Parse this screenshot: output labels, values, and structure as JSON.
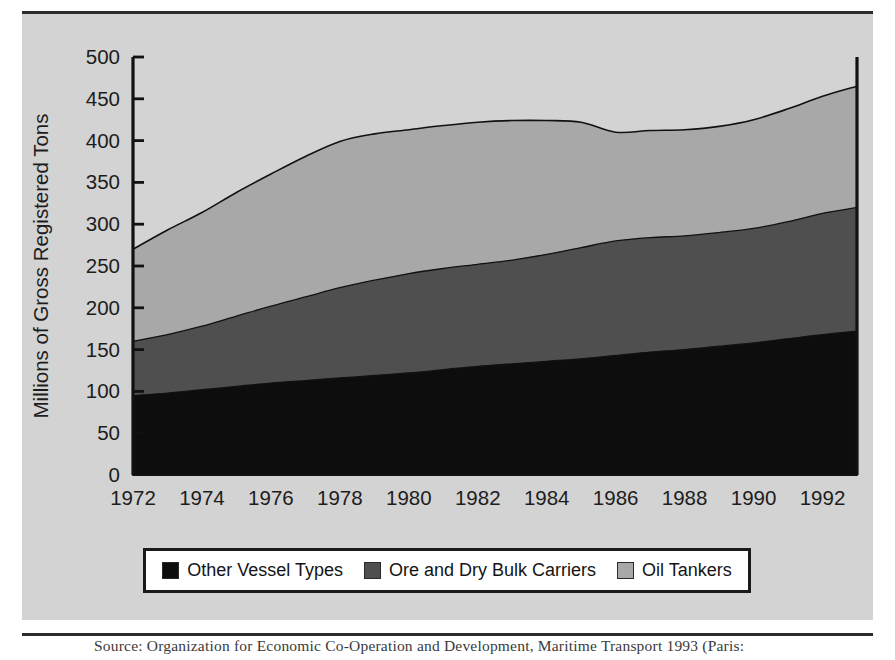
{
  "figure": {
    "caption": "Source: Organization for Economic Co-Operation and Development, Maritime Transport 1993 (Paris:"
  },
  "chart_data": {
    "type": "area",
    "stacked": true,
    "title": "",
    "xlabel": "",
    "ylabel": "Millions of Gross Registered Tons",
    "xlim": [
      1972,
      1993
    ],
    "ylim": [
      0,
      500
    ],
    "grid": false,
    "legend_position": "bottom",
    "x_tick_labels": [
      "1972",
      "1974",
      "1976",
      "1978",
      "1980",
      "1982",
      "1984",
      "1986",
      "1988",
      "1990",
      "1992"
    ],
    "x_ticks": [
      1972,
      1974,
      1976,
      1978,
      1980,
      1982,
      1984,
      1986,
      1988,
      1990,
      1992
    ],
    "y_tick_labels": [
      "0",
      "50",
      "100",
      "150",
      "200",
      "250",
      "300",
      "350",
      "400",
      "450",
      "500"
    ],
    "y_ticks": [
      0,
      50,
      100,
      150,
      200,
      250,
      300,
      350,
      400,
      450,
      500
    ],
    "x": [
      1972,
      1973,
      1974,
      1975,
      1976,
      1977,
      1978,
      1979,
      1980,
      1981,
      1982,
      1983,
      1984,
      1985,
      1986,
      1987,
      1988,
      1989,
      1990,
      1991,
      1992,
      1993
    ],
    "series": [
      {
        "name": "Other Vessel Types",
        "color": "#0d0d0d",
        "values": [
          95,
          98,
          102,
          106,
          110,
          113,
          116,
          119,
          122,
          126,
          130,
          133,
          136,
          139,
          143,
          147,
          150,
          154,
          158,
          163,
          168,
          172
        ]
      },
      {
        "name": "Ore and Dry Bulk Carriers",
        "color": "#4f4f4f",
        "values": [
          65,
          70,
          76,
          84,
          92,
          100,
          108,
          114,
          119,
          121,
          122,
          124,
          128,
          133,
          137,
          137,
          136,
          136,
          137,
          140,
          145,
          148
        ]
      },
      {
        "name": "Oil Tankers",
        "color": "#a8a8a8",
        "values": [
          110,
          125,
          136,
          148,
          158,
          168,
          175,
          175,
          172,
          171,
          170,
          167,
          160,
          150,
          130,
          128,
          127,
          127,
          130,
          135,
          140,
          145
        ]
      }
    ],
    "totals": [
      270,
      293,
      314,
      338,
      360,
      381,
      399,
      408,
      413,
      418,
      422,
      424,
      424,
      422,
      410,
      412,
      413,
      417,
      425,
      438,
      453,
      465
    ]
  },
  "legend": {
    "entries": [
      {
        "label": "Other Vessel Types",
        "color": "#0d0d0d"
      },
      {
        "label": "Ore and Dry Bulk Carriers",
        "color": "#4f4f4f"
      },
      {
        "label": "Oil Tankers",
        "color": "#a8a8a8"
      }
    ]
  }
}
